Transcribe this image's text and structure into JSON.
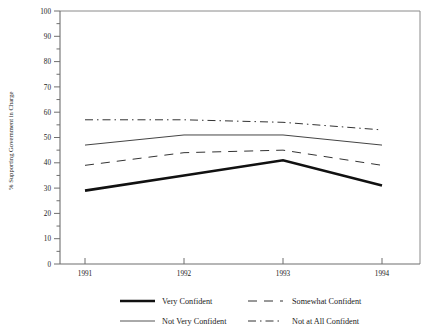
{
  "chart_data": {
    "type": "line",
    "title": "",
    "xlabel": "",
    "ylabel": "% Supporting Government in Charge",
    "categories": [
      "1991",
      "1992",
      "1993",
      "1994"
    ],
    "x": [
      1991,
      1992,
      1993,
      1994
    ],
    "ylim": [
      0,
      100
    ],
    "yticks": [
      0,
      10,
      20,
      30,
      40,
      50,
      60,
      70,
      80,
      90,
      100
    ],
    "ytick_labels": [
      "0",
      "10",
      "20",
      "30",
      "40",
      "50",
      "60",
      "70",
      "80",
      "90",
      "100"
    ],
    "minor_tick_step": 5,
    "grid": false,
    "legend_position": "below-axes",
    "series": [
      {
        "name": "Very Confident",
        "style": "solid-thick",
        "color": "#111111",
        "values": [
          29,
          35,
          41,
          31
        ]
      },
      {
        "name": "Somewhat Confident",
        "style": "dashed",
        "color": "#333333",
        "values": [
          39,
          44,
          45,
          39
        ]
      },
      {
        "name": "Not Very Confident",
        "style": "solid-thin",
        "color": "#444444",
        "values": [
          47,
          51,
          51,
          47
        ]
      },
      {
        "name": "Not at All Confident",
        "style": "dash-dot",
        "color": "#333333",
        "values": [
          57,
          57,
          56,
          53
        ]
      }
    ]
  },
  "axis": {
    "y_title": "% Supporting Government in Charge",
    "y_labels": [
      "100",
      "90",
      "80",
      "70",
      "60",
      "50",
      "40",
      "30",
      "20",
      "10",
      "0"
    ],
    "x_labels": [
      "1991",
      "1992",
      "1993",
      "1994"
    ]
  },
  "legend": {
    "items": [
      {
        "label": "Very Confident",
        "style": "solid-thick"
      },
      {
        "label": "Somewhat Confident",
        "style": "dashed"
      },
      {
        "label": "Not Very Confident",
        "style": "solid-thin"
      },
      {
        "label": "Not at All Confident",
        "style": "dash-dot"
      }
    ]
  }
}
